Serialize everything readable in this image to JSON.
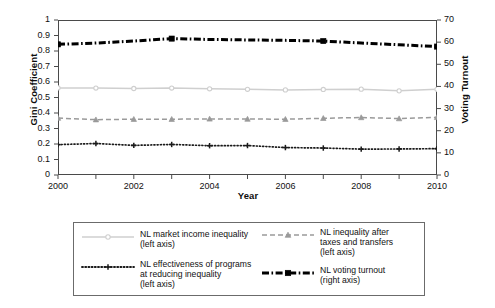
{
  "chart_data": {
    "type": "line",
    "title": "",
    "xlabel": "Year",
    "ylabel": "Gini Coefficient",
    "ylabel_right": "Voting Turnout",
    "grid": false,
    "legend_position": "bottom",
    "x": [
      2000,
      2001,
      2002,
      2003,
      2004,
      2005,
      2006,
      2007,
      2008,
      2009,
      2010
    ],
    "xlim": [
      2000,
      2010
    ],
    "xticks_labeled": [
      "2000",
      "2002",
      "2004",
      "2006",
      "2008",
      "2010"
    ],
    "xticks_all": [
      "2000",
      "2001",
      "2002",
      "2003",
      "2004",
      "2005",
      "2006",
      "2007",
      "2008",
      "2009",
      "2010"
    ],
    "ylim": [
      0,
      1
    ],
    "yticks": [
      "0",
      "0.1",
      "0.2",
      "0.3",
      "0.4",
      "0.5",
      "0.6",
      "0.7",
      "0.8",
      "0.9",
      "1"
    ],
    "ylim_right": [
      0,
      70
    ],
    "yticks_right": [
      "0",
      "10",
      "20",
      "30",
      "40",
      "50",
      "60",
      "70"
    ],
    "series": [
      {
        "name": "NL market income inequality\n(left axis)",
        "legend_label": "NL market income inequality\n(left axis)",
        "axis": "left",
        "color": "#cfcfcf",
        "style": "solid",
        "marker": "circle",
        "values": [
          0.562,
          0.561,
          0.558,
          0.561,
          0.556,
          0.553,
          0.549,
          0.552,
          0.554,
          0.543,
          0.553
        ]
      },
      {
        "name": "NL inequality after\ntaxes and transfers\n(left axis)",
        "legend_label": "NL inequality after\ntaxes and transfers\n(left axis)",
        "axis": "left",
        "color": "#9a9a9a",
        "style": "dashed",
        "marker": "triangle",
        "values": [
          0.367,
          0.357,
          0.36,
          0.36,
          0.362,
          0.361,
          0.36,
          0.366,
          0.371,
          0.364,
          0.372
        ]
      },
      {
        "name": "NL effectiveness of programs\nat reducing inequality\n(left axis)",
        "legend_label": "NL effectiveness of programs\nat reducing inequality\n(left axis)",
        "axis": "left",
        "color": "#1a1a1a",
        "style": "dotted",
        "marker": "plus",
        "values": [
          0.196,
          0.203,
          0.191,
          0.197,
          0.189,
          0.19,
          0.177,
          0.174,
          0.167,
          0.168,
          0.17
        ]
      },
      {
        "name": "NL voting turnout\n(right axis)",
        "legend_label": "NL voting turnout\n(right axis)",
        "axis": "right",
        "color": "#000000",
        "style": "dashdot",
        "marker": "square",
        "marker_years": [
          2000,
          2003,
          2007,
          2010
        ],
        "values": [
          59.0,
          59.6,
          60.5,
          61.6,
          61.2,
          61.0,
          60.8,
          60.5,
          59.6,
          58.8,
          58.0
        ]
      }
    ]
  },
  "colors": {
    "axis": "#4a4a4a",
    "text": "#111111",
    "background": "#ffffff",
    "legend_border": "#6b6b6b"
  }
}
